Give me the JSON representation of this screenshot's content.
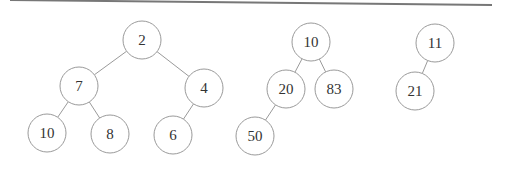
{
  "diagram": {
    "type": "heap-forest",
    "top_rule": {
      "x1": 10,
      "y1": 0,
      "x2": 492,
      "y2": 5,
      "color": "#777777"
    },
    "colors": {
      "stroke": "#9a9a9a",
      "text": "#333333",
      "background": "#ffffff"
    },
    "node_radius": 19,
    "trees": [
      {
        "root": "2",
        "nodes": [
          {
            "id": "a2",
            "label": "2",
            "x": 142,
            "y": 40
          },
          {
            "id": "a7",
            "label": "7",
            "x": 79,
            "y": 86
          },
          {
            "id": "a4",
            "label": "4",
            "x": 204,
            "y": 88
          },
          {
            "id": "a10",
            "label": "10",
            "x": 47,
            "y": 133
          },
          {
            "id": "a8",
            "label": "8",
            "x": 110,
            "y": 134
          },
          {
            "id": "a6",
            "label": "6",
            "x": 173,
            "y": 135
          }
        ],
        "edges": [
          [
            "a2",
            "a7"
          ],
          [
            "a2",
            "a4"
          ],
          [
            "a7",
            "a10"
          ],
          [
            "a7",
            "a8"
          ],
          [
            "a4",
            "a6"
          ]
        ]
      },
      {
        "root": "10",
        "nodes": [
          {
            "id": "b10",
            "label": "10",
            "x": 311,
            "y": 42
          },
          {
            "id": "b20",
            "label": "20",
            "x": 286,
            "y": 89
          },
          {
            "id": "b83",
            "label": "83",
            "x": 334,
            "y": 89
          },
          {
            "id": "b50",
            "label": "50",
            "x": 255,
            "y": 136
          }
        ],
        "edges": [
          [
            "b10",
            "b20"
          ],
          [
            "b10",
            "b83"
          ],
          [
            "b20",
            "b50"
          ]
        ]
      },
      {
        "root": "11",
        "nodes": [
          {
            "id": "c11",
            "label": "11",
            "x": 435,
            "y": 43
          },
          {
            "id": "c21",
            "label": "21",
            "x": 415,
            "y": 91
          }
        ],
        "edges": [
          [
            "c11",
            "c21"
          ]
        ]
      }
    ]
  }
}
